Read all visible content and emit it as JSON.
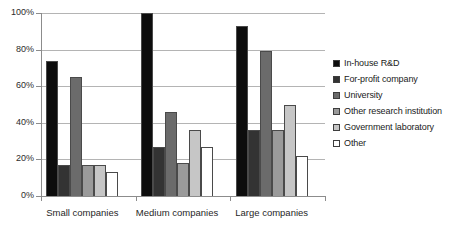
{
  "chart_data": {
    "type": "bar",
    "title": "",
    "subtitle": "",
    "xlabel": "",
    "ylabel": "",
    "ylim": [
      0,
      100
    ],
    "grid": true,
    "legend_position": "right",
    "ytick_labels": [
      "100%",
      "80%",
      "60%",
      "40%",
      "20%",
      "0%"
    ],
    "ytick_values": [
      100,
      80,
      60,
      40,
      20,
      0
    ],
    "categories": [
      "Small companies",
      "Medium companies",
      "Large companies"
    ],
    "series": [
      {
        "name": "In-house R&D",
        "color": "#0d0d0d",
        "values": [
          74,
          100,
          93
        ]
      },
      {
        "name": "For-profit company",
        "color": "#333333",
        "values": [
          17,
          27,
          36
        ]
      },
      {
        "name": "University",
        "color": "#6b6b6b",
        "values": [
          65,
          46,
          79
        ]
      },
      {
        "name": "Other research institution",
        "color": "#9a9a9a",
        "values": [
          17,
          18,
          36
        ]
      },
      {
        "name": "Government laboratory",
        "color": "#c6c6c6",
        "values": [
          17,
          36,
          50
        ]
      },
      {
        "name": "Other",
        "color": "#ffffff",
        "values": [
          13,
          27,
          22
        ]
      }
    ]
  }
}
